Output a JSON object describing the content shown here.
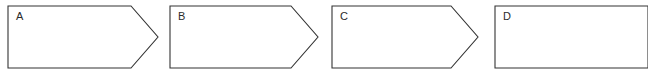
{
  "canvas": {
    "width": 648,
    "height": 82,
    "background_color": "#ffffff",
    "stroke_color": "#333333",
    "label_color": "#2b2b2b"
  },
  "diagram": {
    "type": "chevron-sequence",
    "orientation": "horizontal-left-to-right",
    "fill": "none",
    "shape_top": 6,
    "shape_bottom": 68,
    "shapes": [
      {
        "id": "shape-a",
        "label": "A",
        "left": 8,
        "right": 158,
        "notch_start": 131,
        "top": 6,
        "bottom": 68,
        "tip_y": 37,
        "clipped": "false",
        "label_x": 16,
        "label_y": 11
      },
      {
        "id": "shape-b",
        "label": "B",
        "left": 170,
        "right": 318,
        "notch_start": 291,
        "top": 6,
        "bottom": 68,
        "tip_y": 37,
        "clipped": "false",
        "label_x": 178,
        "label_y": 11
      },
      {
        "id": "shape-c",
        "label": "C",
        "left": 332,
        "right": 478,
        "notch_start": 451,
        "top": 6,
        "bottom": 68,
        "tip_y": 37,
        "clipped": "false",
        "label_x": 340,
        "label_y": 11
      },
      {
        "id": "shape-d",
        "label": "D",
        "left": 495,
        "right": 648,
        "notch_start": 648,
        "top": 6,
        "bottom": 68,
        "tip_y": 37,
        "clipped": "true",
        "label_x": 503,
        "label_y": 11
      }
    ]
  }
}
